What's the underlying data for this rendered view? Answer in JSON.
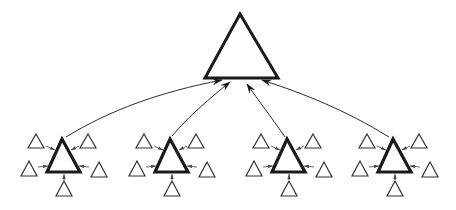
{
  "diagram": {
    "colors": {
      "stroke": "#1a1a1a",
      "background": "#ffffff"
    },
    "root": {
      "shape": "triangle",
      "apex": [
        240,
        14
      ],
      "base_left": [
        205,
        78
      ],
      "base_right": [
        278,
        78
      ]
    },
    "clusters": [
      {
        "id": "cluster-1",
        "center_x": 62,
        "satellites": 5
      },
      {
        "id": "cluster-2",
        "center_x": 170,
        "satellites": 5
      },
      {
        "id": "cluster-3",
        "center_x": 287,
        "satellites": 5
      },
      {
        "id": "cluster-4",
        "center_x": 393,
        "satellites": 5
      }
    ],
    "edges": "each satellite has a small arrow pointing into its cluster hub; each hub has a long curved arrow pointing to the root triangle"
  }
}
